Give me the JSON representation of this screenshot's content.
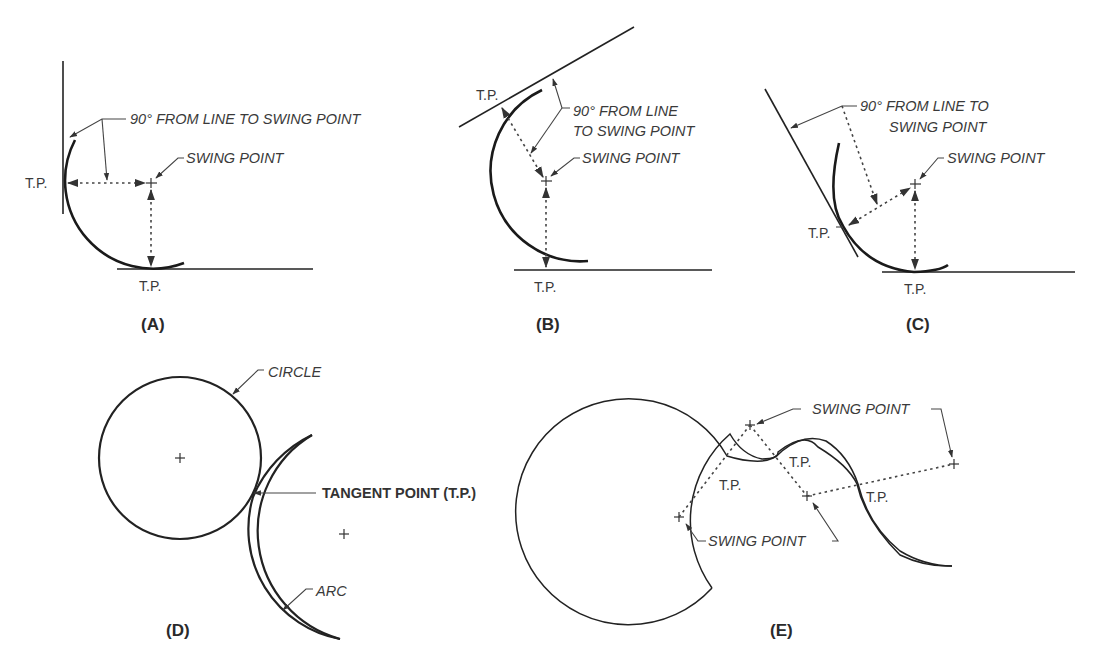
{
  "figure": {
    "panels": [
      {
        "id": "A",
        "caption": "(A)",
        "labels": {
          "angle_note": "90°  FROM LINE TO SWING POINT",
          "swing_point": "SWING POINT",
          "tp_left": "T.P.",
          "tp_bottom": "T.P."
        }
      },
      {
        "id": "B",
        "caption": "(B)",
        "labels": {
          "angle_note_line1": "90° FROM LINE",
          "angle_note_line2": "TO SWING POINT",
          "swing_point": "SWING POINT",
          "tp_top": "T.P.",
          "tp_bottom": "T.P."
        }
      },
      {
        "id": "C",
        "caption": "(C)",
        "labels": {
          "angle_note_line1": "90° FROM LINE TO",
          "angle_note_line2": "SWING POINT",
          "swing_point": "SWING POINT",
          "tp_left": "T.P.",
          "tp_bottom": "T.P."
        }
      },
      {
        "id": "D",
        "caption": "(D)",
        "labels": {
          "circle": "CIRCLE",
          "tangent_point": "TANGENT POINT (T.P.)",
          "arc": "ARC"
        }
      },
      {
        "id": "E",
        "caption": "(E)",
        "labels": {
          "swing_point_top": "SWING POINT",
          "swing_point_bottom": "SWING POINT",
          "tp_1": "T.P.",
          "tp_2": "T.P.",
          "tp_3": "T.P."
        }
      }
    ]
  }
}
